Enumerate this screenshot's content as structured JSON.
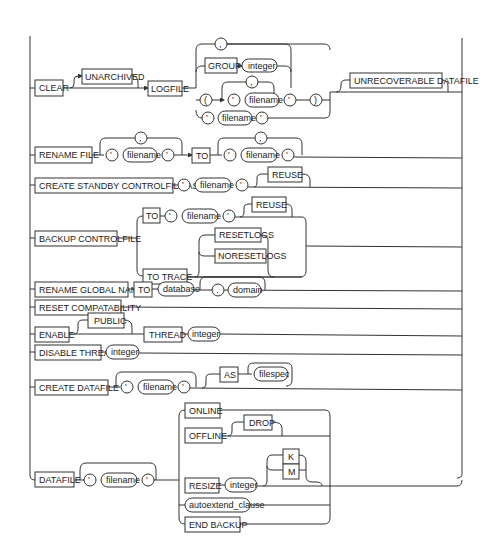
{
  "diagram": {
    "clear": {
      "keyword": "CLEAR",
      "optional": "UNARCHIVED",
      "logfile": "LOGFILE",
      "group": "GROUP",
      "integer": "integer",
      "comma": ",",
      "open_paren": "(",
      "close_paren": ")",
      "quote": "'",
      "filename": "filename",
      "unrecoverable": "UNRECOVERABLE DATAFILE"
    },
    "rename_file": {
      "keyword": "RENAME FILE",
      "to": "TO",
      "filename": "filename",
      "quote": "'",
      "comma": ","
    },
    "create_standby": {
      "keyword": "CREATE STANDBY CONTROLFILE AS",
      "filename": "filename",
      "quote": "'",
      "reuse": "REUSE"
    },
    "backup_controlfile": {
      "keyword": "BACKUP CONTROLFILE",
      "to": "TO",
      "filename": "filename",
      "quote": "'",
      "reuse": "REUSE",
      "to_trace": "TO TRACE",
      "resetlogs": "RESETLOGS",
      "noresetlogs": "NORESETLOGS"
    },
    "rename_global_name": {
      "keyword": "RENAME GLOBAL NAME",
      "to": "TO",
      "database": "database",
      "dot": ".",
      "domain": "domain"
    },
    "reset_compat": {
      "keyword": "RESET COMPATABILITY"
    },
    "enable": {
      "keyword": "ENABLE",
      "public": "PUBLIC",
      "thread": "THREAD",
      "integer": "integer"
    },
    "disable": {
      "keyword": "DISABLE THREAD",
      "integer": "integer"
    },
    "create_datafile": {
      "keyword": "CREATE DATAFILE",
      "filename": "filename",
      "quote": "'",
      "as": "AS",
      "filespec": "filespec"
    },
    "datafile": {
      "keyword": "DATAFILE",
      "filename": "filename",
      "quote": "'",
      "online": "ONLINE",
      "offline": "OFFLINE",
      "drop": "DROP",
      "resize": "RESIZE",
      "integer": "integer",
      "k": "K",
      "m": "M",
      "autoextend": "autoextend_clause",
      "end_backup": "END BACKUP"
    }
  }
}
